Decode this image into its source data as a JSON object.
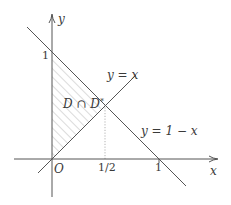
{
  "diagram": {
    "type": "coordinate-region-sketch",
    "axes": {
      "x_label": "x",
      "y_label": "y",
      "origin_label": "O"
    },
    "ticks": {
      "y_one": "1",
      "x_half": "1/2",
      "x_one": "1"
    },
    "lines": [
      {
        "name": "diagonal",
        "label": "y = x"
      },
      {
        "name": "anti-diagonal",
        "label": "y = 1 − x"
      }
    ],
    "region": {
      "label": "D ∩ D*",
      "label_main": "D ∩ D",
      "label_sup": "*",
      "vertices": [
        [
          0,
          0
        ],
        [
          0,
          1
        ],
        [
          0.5,
          0.5
        ]
      ],
      "fill": "hatched"
    },
    "guide": {
      "name": "dotted-vertical-at-half",
      "from": [
        0.5,
        0
      ],
      "to": [
        0.5,
        0.5
      ]
    },
    "colors": {
      "stroke": "#555555",
      "hatch": "#b8b8b8",
      "guide": "#a0a0a0",
      "text": "#3a3a3a"
    }
  }
}
